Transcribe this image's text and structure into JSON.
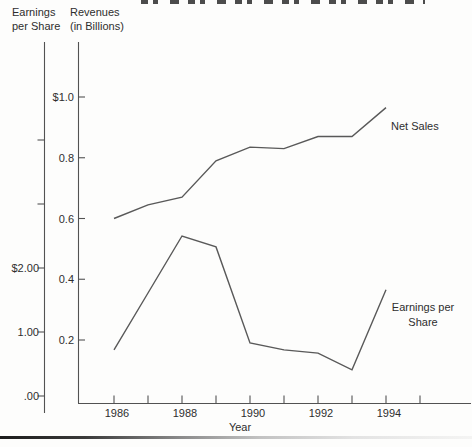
{
  "figure": {
    "left_axis_title_lines": [
      "Earnings",
      "per Share"
    ],
    "right_axis_title_lines": [
      "Revenues",
      "(in Billions)"
    ],
    "xlabel": "Year"
  },
  "chart_data": {
    "type": "line",
    "x": [
      1986,
      1987,
      1988,
      1989,
      1990,
      1991,
      1992,
      1993,
      1994
    ],
    "xlabel": "Year",
    "x_tick_years": [
      1986,
      1987,
      1988,
      1989,
      1990,
      1991,
      1992,
      1993,
      1994,
      1995
    ],
    "x_tick_labels": [
      "1986",
      "",
      "1988",
      "",
      "1990",
      "",
      "1992",
      "",
      "1994",
      ""
    ],
    "grid": false,
    "legend_position": "labels-at-line-ends",
    "left_axis": {
      "title": "Earnings per Share",
      "tick_labels": [
        "$2.00",
        "1.00",
        ".00"
      ],
      "ticks": [
        {
          "value": 0.0,
          "label": ".00"
        },
        {
          "value": 1.0,
          "label": "1.00"
        },
        {
          "value": 2.0,
          "label": "$2.00"
        },
        {
          "value": 3.0,
          "label": ""
        },
        {
          "value": 4.0,
          "label": ""
        }
      ],
      "range": [
        0,
        5.5
      ]
    },
    "right_axis": {
      "title": "Revenues (in Billions)",
      "tick_labels": [
        "$1.0",
        "0.8",
        "0.6",
        "0.4",
        "0.2"
      ],
      "ticks": [
        {
          "value": 0.2,
          "label": "0.2"
        },
        {
          "value": 0.4,
          "label": "0.4"
        },
        {
          "value": 0.6,
          "label": "0.6"
        },
        {
          "value": 0.8,
          "label": "0.8"
        },
        {
          "value": 1.0,
          "label": "$1.0"
        }
      ],
      "range": [
        0,
        1.19
      ]
    },
    "series": [
      {
        "name": "Net Sales",
        "axis": "right",
        "label_lines": [
          "Net Sales"
        ],
        "values": [
          0.6,
          0.645,
          0.67,
          0.79,
          0.835,
          0.83,
          0.87,
          0.87,
          0.965
        ]
      },
      {
        "name": "Earnings per Share",
        "axis": "left",
        "label_lines": [
          "Earnings per",
          "Share"
        ],
        "values": [
          0.72,
          1.61,
          2.5,
          2.33,
          0.83,
          0.72,
          0.67,
          0.41,
          1.66
        ]
      }
    ]
  },
  "colors": {
    "line": "#595959",
    "axis": "#525252",
    "text": "#2e2e2e",
    "background": "#fdfdfc"
  }
}
